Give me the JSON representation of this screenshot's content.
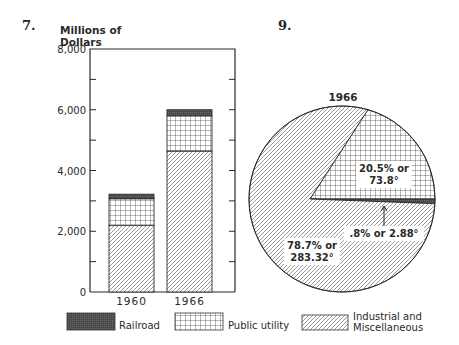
{
  "figures": {
    "bar_number": "7.",
    "pie_number": "9."
  },
  "legend": {
    "items": [
      {
        "key": "railroad",
        "label": "Railroad",
        "pattern": "solid-dark"
      },
      {
        "key": "utility",
        "label": "Public utility",
        "pattern": "grid"
      },
      {
        "key": "industrial",
        "label_line1": "Industrial and",
        "label_line2": "Miscellaneous",
        "pattern": "diagonal"
      }
    ]
  },
  "colors": {
    "ink": "#2a2a2a",
    "railroad_fill": "#555555",
    "background": "#ffffff"
  },
  "chart_data": [
    {
      "type": "bar",
      "stacked": true,
      "title": "",
      "ylabel_line1": "Millions of",
      "ylabel_line2": "Dollars",
      "xlabel": "",
      "ylim": [
        0,
        8000
      ],
      "yticks": [
        0,
        2000,
        4000,
        6000,
        8000
      ],
      "ytick_labels": [
        "0",
        "2,000",
        "4,000",
        "6,000",
        "8,000"
      ],
      "minor_yticks": [
        1000,
        3000,
        5000,
        7000
      ],
      "categories": [
        "1960",
        "1966"
      ],
      "series": [
        {
          "name": "Industrial and Miscellaneous",
          "key": "industrial",
          "values": [
            2200,
            4640
          ]
        },
        {
          "name": "Public utility",
          "key": "utility",
          "values": [
            870,
            1160
          ]
        },
        {
          "name": "Railroad",
          "key": "railroad",
          "values": [
            150,
            200
          ]
        }
      ],
      "grid": false
    },
    {
      "type": "pie",
      "title": "1966",
      "slices": [
        {
          "key": "utility",
          "name": "Public utility",
          "percent": 20.5,
          "degrees": 73.8,
          "label_line1": "20.5% or",
          "label_line2": "73.8°"
        },
        {
          "key": "railroad",
          "name": "Railroad",
          "percent": 0.8,
          "degrees": 2.88,
          "label_line1": ".8% or 2.88°"
        },
        {
          "key": "industrial",
          "name": "Industrial and Miscellaneous",
          "percent": 78.7,
          "degrees": 283.32,
          "label_line1": "78.7% or",
          "label_line2": "283.32°"
        }
      ],
      "start_angle_deg": 16.2
    }
  ]
}
